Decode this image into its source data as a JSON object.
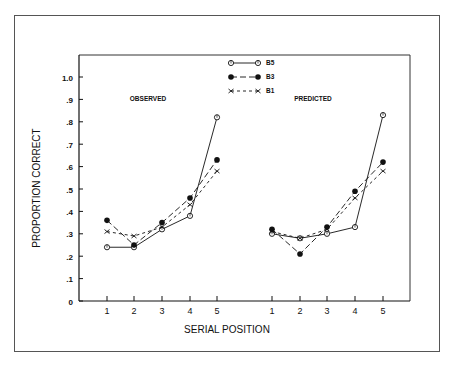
{
  "chart_data": {
    "type": "line",
    "title": "",
    "xlabel": "SERIAL POSITION",
    "ylabel": "PROPORTION CORRECT",
    "ylim": [
      0,
      1.0
    ],
    "yticks": [
      "0",
      ".1",
      ".2",
      ".3",
      ".4",
      ".5",
      ".6",
      ".7",
      ".8",
      ".9",
      "1.0"
    ],
    "grid": false,
    "legend_position": "top-center",
    "legend": [
      {
        "name": "B5",
        "marker": "open-circle",
        "line": "solid"
      },
      {
        "name": "B3",
        "marker": "filled-circle",
        "line": "long-dash"
      },
      {
        "name": "B1",
        "marker": "x",
        "line": "short-dash"
      }
    ],
    "panels": [
      {
        "label": "OBSERVED",
        "x": [
          1,
          2,
          3,
          4,
          5
        ],
        "series": [
          {
            "name": "B5",
            "values": [
              0.24,
              0.24,
              0.32,
              0.38,
              0.82
            ]
          },
          {
            "name": "B3",
            "values": [
              0.36,
              0.25,
              0.35,
              0.46,
              0.63
            ]
          },
          {
            "name": "B1",
            "values": [
              0.31,
              0.29,
              0.33,
              0.43,
              0.58
            ]
          }
        ]
      },
      {
        "label": "PREDICTED",
        "x": [
          1,
          2,
          3,
          4,
          5
        ],
        "series": [
          {
            "name": "B5",
            "values": [
              0.3,
              0.28,
              0.3,
              0.33,
              0.83
            ]
          },
          {
            "name": "B3",
            "values": [
              0.32,
              0.21,
              0.33,
              0.49,
              0.62
            ]
          },
          {
            "name": "B1",
            "values": [
              0.31,
              0.28,
              0.32,
              0.46,
              0.58
            ]
          }
        ]
      }
    ]
  }
}
